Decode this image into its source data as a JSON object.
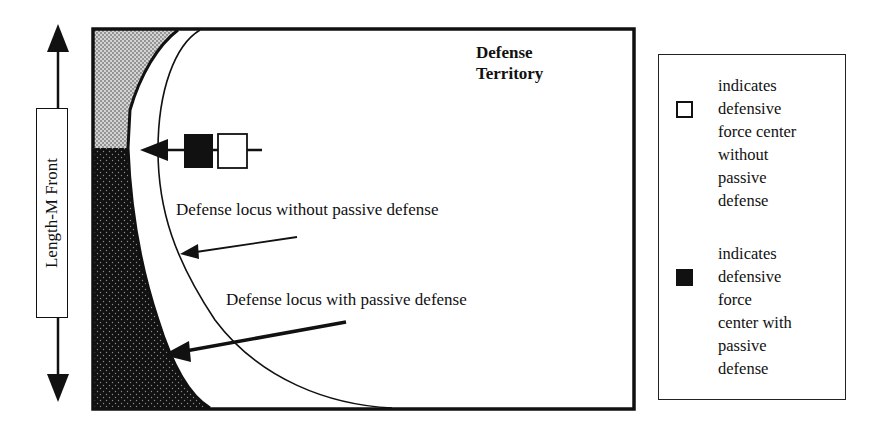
{
  "diagram": {
    "territory_label_line1": "Defense",
    "territory_label_line2": "Territory",
    "front_label": "Length-M Front",
    "locus_without_label": "Defense locus without passive defense",
    "locus_with_label": "Defense locus with passive defense",
    "colors": {
      "ink": "#111111",
      "light_stipple": "#b8b8b8",
      "dark_stipple": "#111111",
      "background": "#ffffff"
    }
  },
  "legend": {
    "items": [
      {
        "swatch": "open-square",
        "lines": [
          "indicates",
          "defensive",
          "force center",
          "without",
          "passive",
          "defense"
        ]
      },
      {
        "swatch": "filled-square",
        "lines": [
          "indicates",
          "defensive",
          "force",
          "center with",
          "passive",
          "defense"
        ]
      }
    ]
  }
}
